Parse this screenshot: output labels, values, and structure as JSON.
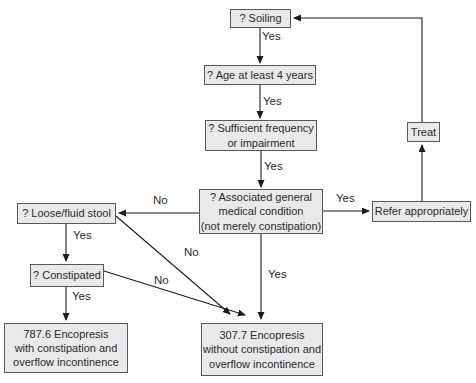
{
  "nodes": {
    "soiling": "? Soiling",
    "age": "? Age at least 4 years",
    "frequency": [
      "? Sufficient frequency",
      "or impairment"
    ],
    "medical": [
      "? Associated general",
      "medical condition",
      "(not merely constipation)"
    ],
    "refer": "Refer appropriately",
    "treat": "Treat",
    "loose": "? Loose/fluid stool",
    "constipated": "? Constipated",
    "dx_787": [
      "787.6 Encopresis",
      "with constipation and",
      "overflow incontinence"
    ],
    "dx_307": [
      "307.7 Encopresis",
      "without constipation and",
      "overflow incontinence"
    ]
  },
  "edge_labels": {
    "soiling_yes": "Yes",
    "age_yes": "Yes",
    "frequency_yes": "Yes",
    "medical_yes_right": "Yes",
    "medical_yes_down": "Yes",
    "loose_yes": "Yes",
    "constipated_yes": "Yes",
    "medical_no": "No",
    "loose_no": "No",
    "constipated_no": "No"
  },
  "colors": {
    "background": "#ffffff",
    "box_fill": "#e9e9e9",
    "box_border": "#585858",
    "line": "#1c1c1c",
    "text": "#2b2b2b"
  }
}
